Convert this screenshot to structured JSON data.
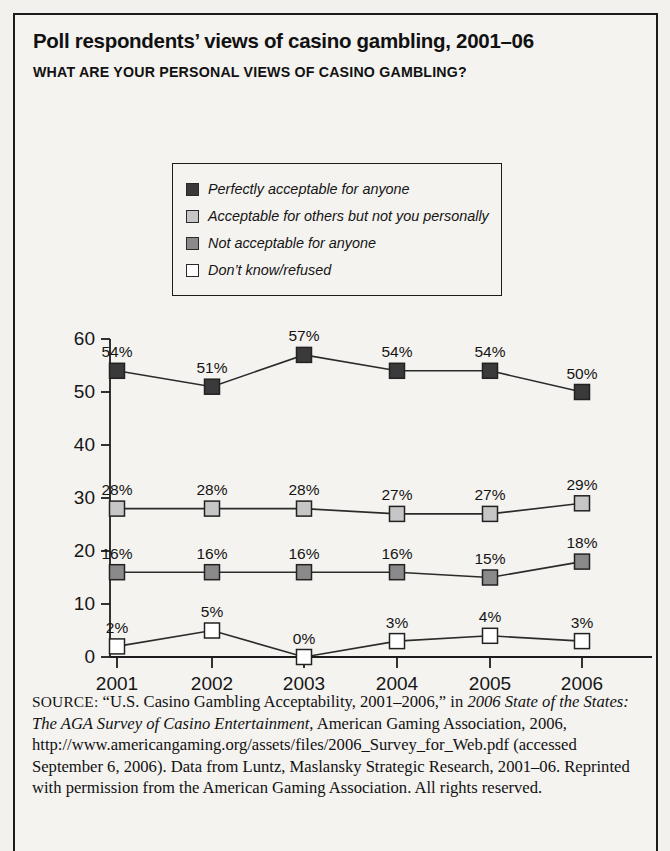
{
  "title": "Poll respondents’ views of casino gambling, 2001–06",
  "subtitle": "WHAT ARE YOUR PERSONAL VIEWS OF CASINO GAMBLING?",
  "colors": {
    "series1": "#3a3a3a",
    "series2": "#c6c6c6",
    "series3": "#8a8a8a",
    "series4": "#ffffff",
    "axis": "#1c1c1c",
    "frame": "#1c1c1c",
    "background": "#f4f3f0"
  },
  "chart_data": {
    "type": "line",
    "title": "Poll respondents’ views of casino gambling, 2001–06",
    "subtitle": "WHAT ARE YOUR PERSONAL VIEWS OF CASINO GAMBLING?",
    "xlabel": "",
    "ylabel": "",
    "categories": [
      "2001",
      "2002",
      "2003",
      "2004",
      "2005",
      "2006"
    ],
    "ylim": [
      0,
      60
    ],
    "yticks": [
      0,
      10,
      20,
      30,
      40,
      50,
      60
    ],
    "grid": false,
    "legend_position": "top-center",
    "value_suffix": "%",
    "series": [
      {
        "name": "Perfectly acceptable for anyone",
        "color": "#3a3a3a",
        "values": [
          54,
          51,
          57,
          54,
          54,
          50
        ],
        "labels": [
          "54%",
          "51%",
          "57%",
          "54%",
          "54%",
          "50%"
        ]
      },
      {
        "name": "Acceptable for others but not you personally",
        "color": "#c6c6c6",
        "values": [
          28,
          28,
          28,
          27,
          27,
          29
        ],
        "labels": [
          "28%",
          "28%",
          "28%",
          "27%",
          "27%",
          "29%"
        ]
      },
      {
        "name": "Not acceptable for anyone",
        "color": "#8a8a8a",
        "values": [
          16,
          16,
          16,
          16,
          15,
          18
        ],
        "labels": [
          "16%",
          "16%",
          "16%",
          "16%",
          "15%",
          "18%"
        ]
      },
      {
        "name": "Don’t know/refused",
        "color": "#ffffff",
        "values": [
          2,
          5,
          0,
          3,
          4,
          3
        ],
        "labels": [
          "2%",
          "5%",
          "0%",
          "3%",
          "4%",
          "3%"
        ]
      }
    ]
  },
  "source": {
    "label": "SOURCE:",
    "part1": " “U.S. Casino Gambling Acceptability, 2001–2006,” in ",
    "italic1": "2006 State of the States: The AGA Survey of Casino Entertainment",
    "part2": ", American Gaming Association, 2006, http://www.americangaming.org/assets/files/2006_Survey_for_Web.pdf (accessed September 6, 2006). Data from Luntz, Maslansky Strategic Research, 2001–06. Reprinted with permission from the American Gaming Association. All rights reserved."
  }
}
